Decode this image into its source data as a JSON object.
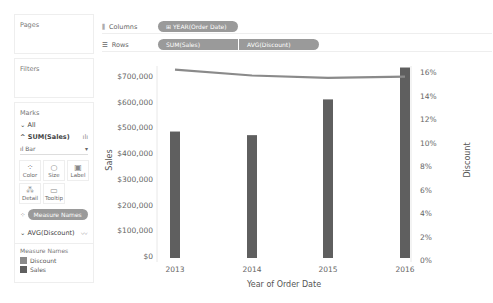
{
  "sidebar": {
    "pages_label": "Pages",
    "filters_label": "Filters",
    "marks": {
      "title": "Marks",
      "all_label": "All",
      "sum_sales_label": "SUM(Sales)",
      "mark_type": "Bar",
      "buttons": [
        {
          "label": "Color",
          "icon": "color-icon"
        },
        {
          "label": "Size",
          "icon": "size-icon"
        },
        {
          "label": "Label",
          "icon": "label-icon"
        },
        {
          "label": "Detail",
          "icon": "detail-icon"
        },
        {
          "label": "Tooltip",
          "icon": "tooltip-icon"
        }
      ],
      "color_pill": "Measure Names",
      "avg_discount_label": "AVG(Discount)"
    },
    "legend": {
      "title": "Measure Names",
      "items": [
        {
          "label": "Discount",
          "color": "#8a8a8a"
        },
        {
          "label": "Sales",
          "color": "#5f5f5f"
        }
      ]
    }
  },
  "shelves": {
    "columns_label": "Columns",
    "columns_pill": "YEAR(Order Date)",
    "rows_label": "Rows",
    "rows_pills": [
      "SUM(Sales)",
      "AVG(Discount)"
    ]
  },
  "chart_data": {
    "type": "bar",
    "title": "",
    "categories": [
      "2013",
      "2014",
      "2015",
      "2016"
    ],
    "xlabel": "Year of Order Date",
    "ylabel": "Sales",
    "y2label": "Discount",
    "ylim": [
      0,
      760000
    ],
    "y2lim": [
      0,
      0.165
    ],
    "yticks": [
      "$0",
      "$100,000",
      "$200,000",
      "$300,000",
      "$400,000",
      "$500,000",
      "$600,000",
      "$700,000"
    ],
    "y2ticks": [
      "0%",
      "2%",
      "4%",
      "6%",
      "8%",
      "10%",
      "12%",
      "14%",
      "16%"
    ],
    "series": [
      {
        "name": "Sales",
        "type": "bar",
        "axis": "left",
        "color": "#5f5f5f",
        "values": [
          484000,
          470000,
          609000,
          733000
        ]
      },
      {
        "name": "Discount",
        "type": "line",
        "axis": "right",
        "color": "#8a8a8a",
        "values": [
          0.162,
          0.157,
          0.155,
          0.156
        ]
      }
    ],
    "grid": false,
    "legend_position": "left-sidebar"
  }
}
